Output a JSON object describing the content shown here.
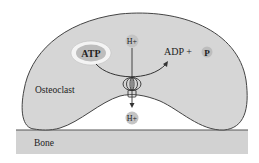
{
  "diagram": {
    "cell_label": "Osteoclast",
    "substrate_label": "Bone",
    "atp_label": "ATP",
    "products": {
      "adp_label": "ADP + ",
      "phosphate_label": "P"
    },
    "proton_top": "H+",
    "proton_bottom": "H+",
    "colors": {
      "cell_fill": "#d6d6d6",
      "bone_fill": "#d2d2d2",
      "outline": "#444444",
      "atp_halo": "#f4f4f4",
      "atp_fill": "#bdbdbd",
      "ion_fill": "#c4c4c4"
    }
  }
}
